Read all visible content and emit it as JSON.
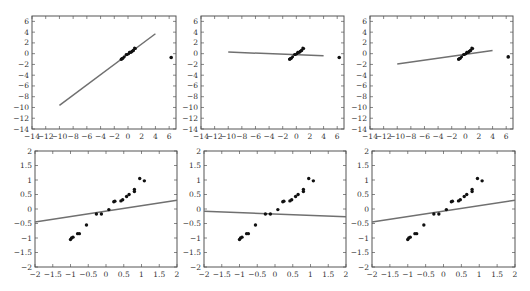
{
  "chart_data": [
    {
      "type": "scatter",
      "title": "",
      "xlabel": "",
      "ylabel": "",
      "xlim": [
        -14,
        7
      ],
      "ylim": [
        -14,
        7
      ],
      "xticks": [
        -14,
        -12,
        -10,
        -8,
        -6,
        -4,
        -2,
        0,
        2,
        4,
        6
      ],
      "yticks": [
        6,
        4,
        2,
        0,
        -2,
        -4,
        -6,
        -8,
        -10,
        -12,
        -14
      ],
      "grid": false,
      "box": {
        "left": 32,
        "top": 16,
        "right": 176,
        "bottom": 129
      },
      "fit_line": {
        "x1": -10,
        "y1": -9.6,
        "x2": 4,
        "y2": 3.7
      },
      "outlier": {
        "x": 6.3,
        "y": -0.7
      },
      "series": [
        {
          "name": "points",
          "cluster": "dense cluster along fit from (-1,-1) to (1,1)"
        }
      ]
    },
    {
      "type": "scatter",
      "xlim": [
        -14,
        7
      ],
      "ylim": [
        -14,
        7
      ],
      "xticks": [
        -14,
        -12,
        -10,
        -8,
        -6,
        -4,
        -2,
        0,
        2,
        4,
        6
      ],
      "yticks": [
        6,
        4,
        2,
        0,
        -2,
        -4,
        -6,
        -8,
        -10,
        -12,
        -14
      ],
      "grid": false,
      "box": {
        "left": 201,
        "top": 16,
        "right": 344,
        "bottom": 129
      },
      "fit_line": {
        "x1": -10,
        "y1": 0.3,
        "x2": 4,
        "y2": -0.4
      },
      "outlier": {
        "x": 6.3,
        "y": -0.7
      }
    },
    {
      "type": "scatter",
      "xlim": [
        -14,
        7
      ],
      "ylim": [
        -14,
        7
      ],
      "xticks": [
        -14,
        -12,
        -10,
        -8,
        -6,
        -4,
        -2,
        0,
        2,
        4,
        6
      ],
      "yticks": [
        6,
        4,
        2,
        0,
        -2,
        -4,
        -6,
        -8,
        -10,
        -12,
        -14
      ],
      "grid": false,
      "box": {
        "left": 370,
        "top": 16,
        "right": 513,
        "bottom": 129
      },
      "fit_line": {
        "x1": -10,
        "y1": -1.9,
        "x2": 4,
        "y2": 0.6
      },
      "outlier": {
        "x": 6.3,
        "y": -0.6
      }
    },
    {
      "type": "scatter",
      "xlim": [
        -2,
        2
      ],
      "ylim": [
        -2,
        2
      ],
      "xticks": [
        -2,
        -1.5,
        -1,
        -0.5,
        0,
        0.5,
        1,
        1.5,
        2
      ],
      "yticks": [
        2,
        1.5,
        1,
        0.5,
        0,
        -0.5,
        -1,
        -1.5,
        -2
      ],
      "grid": false,
      "box": {
        "left": 35,
        "top": 151,
        "right": 177,
        "bottom": 267
      },
      "fit_line": {
        "x1": -2,
        "y1": -0.45,
        "x2": 2,
        "y2": 0.3
      }
    },
    {
      "type": "scatter",
      "xlim": [
        -2,
        2
      ],
      "ylim": [
        -2,
        2
      ],
      "xticks": [
        -2,
        -1.5,
        -1,
        -0.5,
        0,
        0.5,
        1,
        1.5,
        2
      ],
      "yticks": [
        2,
        1.5,
        1,
        0.5,
        0,
        -0.5,
        -1,
        -1.5,
        -2
      ],
      "grid": false,
      "box": {
        "left": 204,
        "top": 151,
        "right": 346,
        "bottom": 267
      },
      "fit_line": {
        "x1": -2,
        "y1": -0.08,
        "x2": 2,
        "y2": -0.27
      }
    },
    {
      "type": "scatter",
      "xlim": [
        -2,
        2
      ],
      "ylim": [
        -2,
        2
      ],
      "xticks": [
        -2,
        -1.5,
        -1,
        -0.5,
        0,
        0.5,
        1,
        1.5,
        2
      ],
      "yticks": [
        2,
        1.5,
        1,
        0.5,
        0,
        -0.5,
        -1,
        -1.5,
        -2
      ],
      "grid": false,
      "box": {
        "left": 372,
        "top": 151,
        "right": 515,
        "bottom": 267
      },
      "fit_line": {
        "x1": -2,
        "y1": -0.45,
        "x2": 2,
        "y2": 0.3
      }
    }
  ],
  "points": {
    "x": [
      -1.0,
      -0.97,
      -0.93,
      -0.8,
      -0.75,
      -0.55,
      -0.27,
      -0.13,
      0.08,
      0.22,
      0.25,
      0.42,
      0.47,
      0.58,
      0.65,
      0.8,
      0.8,
      0.95,
      1.08
    ],
    "y": [
      -1.05,
      -1.0,
      -0.97,
      -0.85,
      -0.85,
      -0.55,
      -0.17,
      -0.17,
      -0.02,
      0.25,
      0.27,
      0.28,
      0.32,
      0.43,
      0.5,
      0.6,
      0.67,
      1.05,
      0.97
    ]
  },
  "colors": {
    "axis": "#555555",
    "fit_line": "#707070",
    "point": "#111111",
    "background": "#ffffff"
  }
}
